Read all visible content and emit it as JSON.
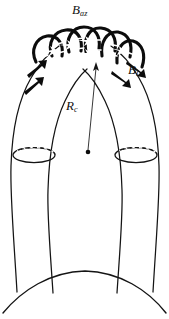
{
  "figure": {
    "background_color": "#ffffff",
    "stroke_color": "#111111",
    "width": 169,
    "height": 319
  },
  "labels": {
    "azimuthal_field": {
      "symbol": "B",
      "subscript": "az",
      "x": 72,
      "y": 3
    },
    "longitudinal_field": {
      "symbol": "B",
      "subscript": "l",
      "x": 128,
      "y": 63
    },
    "radius_of_curvature": {
      "symbol": "R",
      "subscript": "c",
      "x": 66,
      "y": 99
    }
  },
  "annotations": {
    "curvature_center_dot": {
      "x": 88,
      "y": 152
    },
    "curvature_leader_from": {
      "x": 88,
      "y": 150
    },
    "curvature_leader_to": {
      "x": 95,
      "y": 64
    }
  },
  "geometry": {
    "tube_left_outer": "M 18,290 L 10,168 L 14,118 L 30,72 L 56,44",
    "tube_left_inner": "M 54,292 L 48,196 L 52,140 L 66,96 L 84,68",
    "tube_right_outer": "M 152,290 L 158,168 L 154,118 L 138,72 L 112,44",
    "tube_right_inner": "M 116,292 L 120,196 L 116,140 L 102,96 L 86,68",
    "photosphere_arc": "M 4,312 Q 84,262 166,312",
    "left_ellipse": {
      "cx": 34,
      "cy": 155,
      "rx": 21,
      "ry": 7.5
    },
    "right_ellipse": {
      "cx": 136,
      "cy": 155,
      "rx": 21,
      "ry": 7.5
    }
  },
  "helix": {
    "band_count": 6,
    "description": "azimuthal field strands wound around apex of tube",
    "arrow_count_apex": 5,
    "arrow_count_left_leg": 2,
    "arrow_count_right_leg": 2
  }
}
